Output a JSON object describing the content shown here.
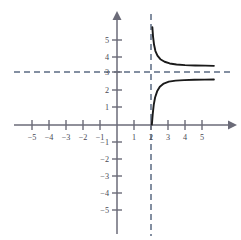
{
  "figure": {
    "name": "rational-function-graph",
    "background_color": "#ffffff"
  },
  "chart_data": {
    "type": "line",
    "title": "",
    "subtitle": "",
    "xlabel": "",
    "ylabel": "",
    "xlim": [
      -5.8,
      5.9
    ],
    "ylim": [
      -5.9,
      5.8
    ],
    "grid": false,
    "legend": null,
    "axis_color": "#6b6b78",
    "curve_color": "#1a1a1a",
    "asymptote_color": "#5b6b82",
    "x_ticks": [
      -5,
      -4,
      -3,
      -2,
      -1,
      1,
      2,
      3,
      4,
      5
    ],
    "y_ticks": [
      -5,
      -4,
      -3,
      -2,
      -1,
      1,
      2,
      3,
      4,
      5
    ],
    "x_tick_labels": [
      "−5",
      "−4",
      "−3",
      "−2",
      "−1",
      "1",
      "2",
      "3",
      "4",
      "5"
    ],
    "y_tick_labels": [
      "−5",
      "−4",
      "−3",
      "−2",
      "−1",
      "1",
      "2",
      "3",
      "4",
      "5"
    ],
    "asymptotes": [
      {
        "name": "vertical-asymptote",
        "orientation": "vertical",
        "value": 2,
        "label": "x = 2",
        "style": "dashed"
      },
      {
        "name": "horizontal-asymptote",
        "orientation": "horizontal",
        "value": 3,
        "label": "y = 3",
        "style": "dashed"
      }
    ],
    "series": [
      {
        "name": "upper-branch",
        "comment": "branch for x > 2, decreasing from +infinity toward y = 3",
        "x": [
          2.08,
          2.12,
          2.18,
          2.26,
          2.38,
          2.55,
          2.8,
          3.1,
          3.5,
          4.0,
          4.6,
          5.2,
          5.7
        ],
        "y": [
          5.75,
          5.2,
          4.72,
          4.35,
          4.08,
          3.87,
          3.72,
          3.62,
          3.56,
          3.52,
          3.5,
          3.49,
          3.48
        ]
      },
      {
        "name": "lower-branch",
        "comment": "branch rising from the x-axis near x = 2 toward y = 3 from below",
        "x": [
          2.05,
          2.1,
          2.16,
          2.24,
          2.36,
          2.52,
          2.75,
          3.05,
          3.45,
          3.95,
          4.55,
          5.15,
          5.7
        ],
        "y": [
          0.02,
          0.62,
          1.18,
          1.62,
          1.98,
          2.25,
          2.44,
          2.55,
          2.61,
          2.64,
          2.66,
          2.67,
          2.68
        ]
      }
    ]
  }
}
